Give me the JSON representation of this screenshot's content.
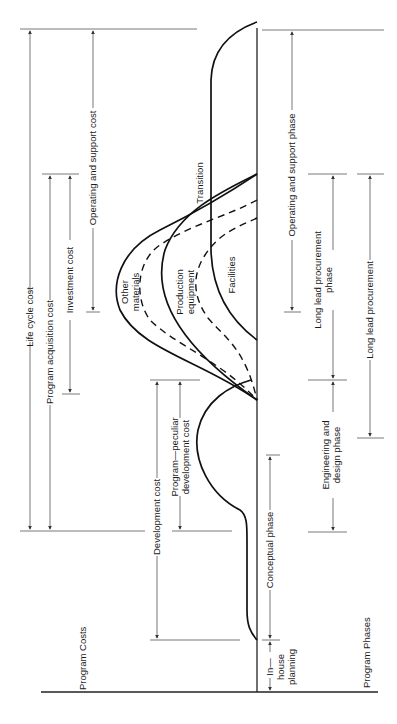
{
  "diagram": {
    "orientation": "rotated 90 degrees counter-clockwise (time axis runs bottom to top)",
    "axis_labels": {
      "costs": "Program Costs",
      "phases": "Program Phases"
    },
    "cost_spans": [
      {
        "id": "life_cycle",
        "label": "Life cycle cost"
      },
      {
        "id": "program_acquisition",
        "label": "Program acquisition cost"
      },
      {
        "id": "investment",
        "label": "Investment cost"
      },
      {
        "id": "operating_support",
        "label": "Operating and support cost"
      },
      {
        "id": "development",
        "label": "Development cost"
      },
      {
        "id": "program_peculiar",
        "label_line1": "Program—peculiar",
        "label_line2": "development cost"
      }
    ],
    "curve_labels": {
      "other_materials_1": "Other",
      "other_materials_2": "materials",
      "production_1": "Production",
      "production_2": "equipment",
      "facilities": "Facilities",
      "transition": "Transition"
    },
    "phase_spans": [
      {
        "id": "in_house",
        "label_line1": "In—",
        "label_line2": "house",
        "label_line3": "planning"
      },
      {
        "id": "conceptual",
        "label": "Conceptual phase"
      },
      {
        "id": "engineering",
        "label_line1": "Engineering and",
        "label_line2": "design phase"
      },
      {
        "id": "construction",
        "label_line1": "Construction",
        "label_line2": "and",
        "label_line3": "procurement",
        "label_line4": "phase"
      },
      {
        "id": "long_lead",
        "label_line1": "Long lead procurement",
        "label_line2": "phase"
      },
      {
        "id": "operating_support_phase",
        "label": "Operating and support phase"
      }
    ],
    "colors": {
      "ink": "#111111",
      "guide": "#555555",
      "background": "#ffffff"
    }
  }
}
